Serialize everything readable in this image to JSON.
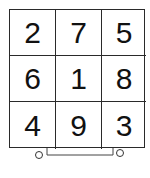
{
  "puzzle": {
    "type": "3x3 number grid on cart",
    "rows": [
      [
        "2",
        "7",
        "5"
      ],
      [
        "6",
        "1",
        "8"
      ],
      [
        "4",
        "9",
        "3"
      ]
    ]
  },
  "colors": {
    "line": "#2a2a2a",
    "text": "#111111",
    "background": "#ffffff"
  }
}
